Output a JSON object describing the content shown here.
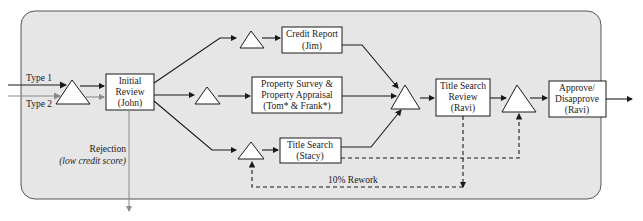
{
  "colors": {
    "panel_fill": "#e6e6e6",
    "panel_stroke": "#555555",
    "box_fill": "#ffffff",
    "line": "#1a1a1a",
    "type2_line": "#8a8a8a",
    "rejection_line": "#8a8a8a"
  },
  "inputs": {
    "type1": "Type 1",
    "type2": "Type 2"
  },
  "activities": {
    "initial_review": [
      "Initial",
      "Review",
      "(John)"
    ],
    "credit_report": [
      "Credit Report",
      "(Jim)"
    ],
    "property": [
      "Property Survey &",
      "Property Appraisal",
      "(Tom* & Frank*)"
    ],
    "title_search": [
      "Title Search",
      "(Stacy)"
    ],
    "title_review": [
      "Title Search",
      "Review",
      "(Ravi)"
    ],
    "approve": [
      "Approve/",
      "Disapprove",
      "(Ravi)"
    ]
  },
  "labels": {
    "rejection": "Rejection",
    "rejection_reason": "(low credit score)",
    "rework": "10% Rework"
  },
  "legend": {
    "queue_symbol": "triangle = inventory/queue"
  }
}
